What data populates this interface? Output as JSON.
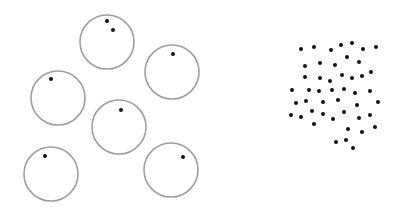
{
  "figure": {
    "background": "#ffffff",
    "circle_stroke": "#9e9e9e",
    "dot_color": "#111111",
    "left_panel": {
      "description": "six circles each containing one or two dots",
      "circles": [
        {
          "cx": 107,
          "cy": 42,
          "r": 27,
          "dots": [
            [
              107,
              21
            ],
            [
              113,
              30
            ]
          ]
        },
        {
          "cx": 172,
          "cy": 72,
          "r": 27,
          "dots": [
            [
              173,
              54
            ]
          ]
        },
        {
          "cx": 58,
          "cy": 98,
          "r": 27,
          "dots": [
            [
              51,
              79
            ]
          ]
        },
        {
          "cx": 119,
          "cy": 127,
          "r": 27,
          "dots": [
            [
              121,
              110
            ]
          ]
        },
        {
          "cx": 51,
          "cy": 174,
          "r": 27,
          "dots": [
            [
              45,
              156
            ]
          ]
        },
        {
          "cx": 171,
          "cy": 170,
          "r": 27,
          "dots": [
            [
              183,
              157
            ]
          ]
        }
      ]
    },
    "right_panel": {
      "description": "scattered cluster of dots",
      "dots": [
        [
          301,
          49
        ],
        [
          314,
          47
        ],
        [
          331,
          50
        ],
        [
          341,
          45
        ],
        [
          352,
          43
        ],
        [
          363,
          49
        ],
        [
          376,
          47
        ],
        [
          305,
          66
        ],
        [
          320,
          63
        ],
        [
          335,
          65
        ],
        [
          347,
          57
        ],
        [
          359,
          62
        ],
        [
          305,
          77
        ],
        [
          320,
          78
        ],
        [
          330,
          81
        ],
        [
          342,
          75
        ],
        [
          352,
          78
        ],
        [
          362,
          76
        ],
        [
          371,
          72
        ],
        [
          292,
          90
        ],
        [
          309,
          90
        ],
        [
          319,
          91
        ],
        [
          332,
          90
        ],
        [
          344,
          89
        ],
        [
          355,
          93
        ],
        [
          370,
          91
        ],
        [
          296,
          103
        ],
        [
          306,
          101
        ],
        [
          323,
          102
        ],
        [
          338,
          100
        ],
        [
          357,
          105
        ],
        [
          378,
          102
        ],
        [
          291,
          115
        ],
        [
          301,
          117
        ],
        [
          312,
          111
        ],
        [
          323,
          114
        ],
        [
          333,
          119
        ],
        [
          344,
          112
        ],
        [
          359,
          118
        ],
        [
          370,
          115
        ],
        [
          314,
          124
        ],
        [
          348,
          129
        ],
        [
          362,
          132
        ],
        [
          375,
          127
        ],
        [
          336,
          142
        ],
        [
          346,
          140
        ],
        [
          353,
          148
        ]
      ]
    }
  }
}
